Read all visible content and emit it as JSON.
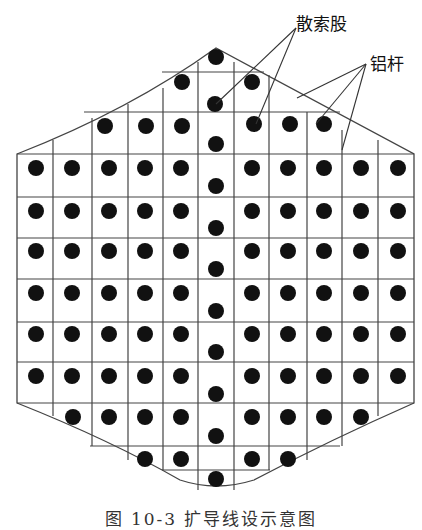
{
  "labels": {
    "strand": "散索股",
    "rod": "铝杆"
  },
  "caption": "图 10-3   扩导线设示意图",
  "colors": {
    "line": "#333333",
    "dot": "#111111",
    "background": "#ffffff"
  },
  "grid": {
    "columns_x": [
      17,
      53,
      92,
      128,
      163,
      198,
      234,
      269,
      307,
      342,
      378,
      414
    ],
    "rows_y": [
      72,
      112,
      154,
      197,
      238,
      279,
      322,
      362,
      403,
      446
    ]
  },
  "dots": [
    [
      216,
      57
    ],
    [
      182,
      82
    ],
    [
      252,
      82
    ],
    [
      215,
      104
    ],
    [
      105,
      126
    ],
    [
      146,
      126
    ],
    [
      182,
      126
    ],
    [
      254,
      124
    ],
    [
      290,
      124
    ],
    [
      324,
      124
    ],
    [
      216,
      144
    ],
    [
      36,
      168
    ],
    [
      72,
      168
    ],
    [
      109,
      168
    ],
    [
      145,
      168
    ],
    [
      181,
      168
    ],
    [
      252,
      168
    ],
    [
      288,
      168
    ],
    [
      324,
      168
    ],
    [
      361,
      168
    ],
    [
      398,
      168
    ],
    [
      216,
      186
    ],
    [
      36,
      211
    ],
    [
      72,
      211
    ],
    [
      109,
      211
    ],
    [
      145,
      211
    ],
    [
      181,
      211
    ],
    [
      252,
      211
    ],
    [
      288,
      211
    ],
    [
      324,
      211
    ],
    [
      361,
      211
    ],
    [
      398,
      211
    ],
    [
      216,
      228
    ],
    [
      36,
      251
    ],
    [
      72,
      251
    ],
    [
      109,
      251
    ],
    [
      145,
      251
    ],
    [
      181,
      251
    ],
    [
      252,
      251
    ],
    [
      288,
      251
    ],
    [
      324,
      251
    ],
    [
      361,
      251
    ],
    [
      398,
      251
    ],
    [
      216,
      269
    ],
    [
      36,
      293
    ],
    [
      72,
      293
    ],
    [
      109,
      293
    ],
    [
      145,
      293
    ],
    [
      181,
      293
    ],
    [
      252,
      293
    ],
    [
      288,
      293
    ],
    [
      324,
      293
    ],
    [
      361,
      293
    ],
    [
      398,
      293
    ],
    [
      216,
      311
    ],
    [
      36,
      334
    ],
    [
      72,
      334
    ],
    [
      109,
      334
    ],
    [
      145,
      334
    ],
    [
      181,
      334
    ],
    [
      252,
      334
    ],
    [
      288,
      334
    ],
    [
      324,
      334
    ],
    [
      361,
      334
    ],
    [
      398,
      334
    ],
    [
      216,
      352
    ],
    [
      36,
      376
    ],
    [
      72,
      376
    ],
    [
      109,
      376
    ],
    [
      145,
      376
    ],
    [
      181,
      376
    ],
    [
      252,
      376
    ],
    [
      288,
      376
    ],
    [
      324,
      376
    ],
    [
      361,
      376
    ],
    [
      398,
      376
    ],
    [
      216,
      394
    ],
    [
      73,
      417
    ],
    [
      109,
      417
    ],
    [
      145,
      417
    ],
    [
      181,
      417
    ],
    [
      252,
      417
    ],
    [
      288,
      417
    ],
    [
      324,
      417
    ],
    [
      361,
      417
    ],
    [
      216,
      436
    ],
    [
      145,
      459
    ],
    [
      181,
      459
    ],
    [
      252,
      459
    ],
    [
      288,
      459
    ],
    [
      216,
      479
    ]
  ]
}
